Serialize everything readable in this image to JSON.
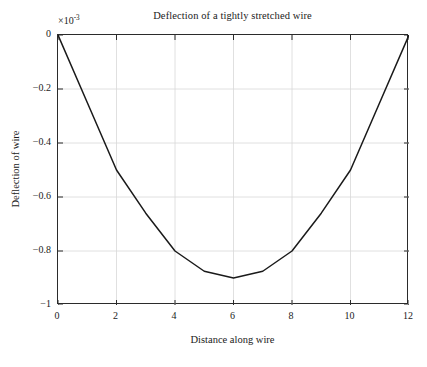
{
  "chart_data": {
    "type": "line",
    "title": "Deflection of a tightly stretched wire",
    "xlabel": "Distance along wire",
    "ylabel": "Deflection of wire",
    "y_multiplier_label": "×10",
    "y_multiplier_exponent": "-3",
    "y_multiplier_value": 0.001,
    "xlim": [
      0,
      12
    ],
    "ylim": [
      -1,
      0
    ],
    "grid": true,
    "legend": null,
    "x": [
      0,
      1,
      2,
      3,
      4,
      5,
      6,
      7,
      8,
      9,
      10,
      11,
      12
    ],
    "values": [
      0,
      -0.25,
      -0.5,
      -0.66,
      -0.8,
      -0.875,
      -0.9,
      -0.875,
      -0.8,
      -0.66,
      -0.5,
      -0.25,
      0
    ],
    "series": [
      {
        "name": "Deflection",
        "color": "#1a1a1a",
        "values": [
          0,
          -0.25,
          -0.5,
          -0.66,
          -0.8,
          -0.875,
          -0.9,
          -0.875,
          -0.8,
          -0.66,
          -0.5,
          -0.25,
          0
        ]
      }
    ],
    "x_ticks": [
      0,
      2,
      4,
      6,
      8,
      10,
      12
    ],
    "x_tick_labels": [
      "0",
      "2",
      "4",
      "6",
      "8",
      "10",
      "12"
    ],
    "y_ticks": [
      0,
      -0.2,
      -0.4,
      -0.6,
      -0.8,
      -1
    ],
    "y_tick_labels": [
      "0",
      "−0.2",
      "−0.4",
      "−0.6",
      "−0.8",
      "−1"
    ],
    "colors": {
      "line": "#1a1a1a",
      "grid": "#d8d8d8",
      "axis": "#2b2b2b",
      "background": "#ffffff",
      "text": "#1a1a1a"
    }
  }
}
